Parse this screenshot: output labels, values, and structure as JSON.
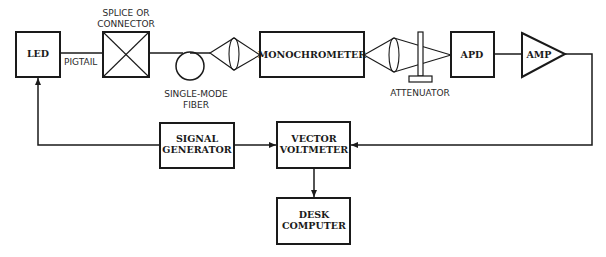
{
  "diagram": {
    "blocks": {
      "led": "LED",
      "monochrometer": "MONOCHROMETER",
      "apd": "APD",
      "amp": "AMP",
      "signal_generator": [
        "SIGNAL",
        "GENERATOR"
      ],
      "vector_voltmeter": [
        "VECTOR",
        "VOLTMETER"
      ],
      "desk_computer": [
        "DESK",
        "COMPUTER"
      ]
    },
    "labels": {
      "pigtail": "PIGTAIL",
      "splice": [
        "SPLICE OR",
        "CONNECTOR"
      ],
      "fiber": [
        "SINGLE-MODE",
        "FIBER"
      ],
      "attenuator": "ATTENUATOR"
    },
    "colors": {
      "ink": "#1a1a1a",
      "background": "#ffffff"
    }
  }
}
